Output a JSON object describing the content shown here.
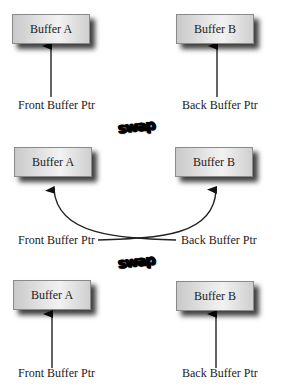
{
  "diagram": {
    "title": "",
    "stages": [
      {
        "buffer_a": "Buffer A",
        "buffer_b": "Buffer B",
        "front_ptr": "Front Buffer Ptr",
        "back_ptr": "Back Buffer Ptr",
        "pointers": "straight"
      },
      {
        "buffer_a": "Buffer A",
        "buffer_b": "Buffer B",
        "front_ptr": "Front Buffer Ptr",
        "back_ptr": "Back Buffer Ptr",
        "pointers": "crossed"
      },
      {
        "buffer_a": "Buffer A",
        "buffer_b": "Buffer B",
        "front_ptr": "Front Buffer Ptr",
        "back_ptr": "Back Buffer Ptr",
        "pointers": "straight"
      }
    ],
    "swap_labels": [
      "swap",
      "swap"
    ]
  }
}
